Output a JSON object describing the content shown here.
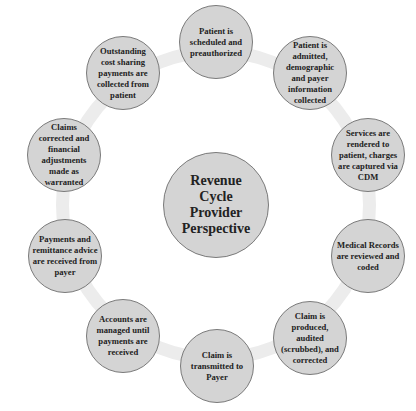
{
  "diagram": {
    "type": "cycle",
    "center": {
      "label": "Revenue Cycle Provider Perspective"
    },
    "steps": [
      {
        "label": "Patient is scheduled and preauthorized"
      },
      {
        "label": "Patient is admitted, demographic and payer information collected"
      },
      {
        "label": "Services are rendered to patient, charges are captured via CDM"
      },
      {
        "label": "Medical Records are reviewed and coded"
      },
      {
        "label": "Claim is produced, audited (scrubbed), and corrected"
      },
      {
        "label": "Claim is transmitted to Payer"
      },
      {
        "label": "Accounts are managed until payments are received"
      },
      {
        "label": "Payments and remittance advice are received from payer"
      },
      {
        "label": "Claims corrected and financial adjustments made as warranted"
      },
      {
        "label": "Outstanding cost sharing payments are collected from patient"
      }
    ],
    "colors": {
      "node_fill": "#d4d4d4",
      "node_border": "#7a7a7a",
      "ring": "#ececec",
      "text": "#222222"
    }
  }
}
